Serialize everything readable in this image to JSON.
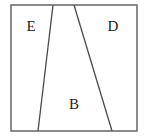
{
  "diagram": {
    "background_color": "#ffffff",
    "stroke_color": "#4a4a4a",
    "frame_color": "#5a5a5a",
    "label_color": "#1a1a1a",
    "frame": {
      "name": "outer-rectangle",
      "x": 11,
      "y": 5,
      "width": 126,
      "height": 126
    },
    "dividers": [
      {
        "name": "left-divider",
        "x1": 53,
        "y1": 5,
        "x2": 38,
        "y2": 131
      },
      {
        "name": "right-divider",
        "x1": 74,
        "y1": 5,
        "x2": 112,
        "y2": 131
      }
    ],
    "regions": [
      {
        "id": "region-e",
        "label": "E",
        "label_x": 31,
        "label_y": 28,
        "polygon": "11,5 53,5 38,131 11,131"
      },
      {
        "id": "region-b",
        "label": "B",
        "label_x": 74,
        "label_y": 106,
        "polygon": "53,5 74,5 112,131 38,131"
      },
      {
        "id": "region-d",
        "label": "D",
        "label_x": 113,
        "label_y": 28,
        "polygon": "74,5 137,5 137,131 112,131"
      }
    ]
  }
}
